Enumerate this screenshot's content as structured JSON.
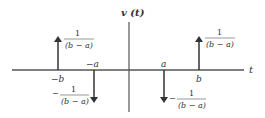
{
  "diagram": {
    "title": "v (t)",
    "axis_label": "t",
    "colors": {
      "line": "#333333",
      "text": "#333333"
    },
    "impulses": [
      {
        "position": "-b",
        "label": "−b",
        "direction": "up",
        "weight_sign": "",
        "weight_num": "1",
        "weight_den": "(b − a)"
      },
      {
        "position": "-a",
        "label": "−a",
        "direction": "down",
        "weight_sign": "−",
        "weight_num": "1",
        "weight_den": "(b − a)"
      },
      {
        "position": "a",
        "label": "a",
        "direction": "down",
        "weight_sign": "−",
        "weight_num": "1",
        "weight_den": "(b − a)"
      },
      {
        "position": "b",
        "label": "b",
        "direction": "up",
        "weight_sign": "",
        "weight_num": "1",
        "weight_den": "(b − a)"
      }
    ]
  }
}
